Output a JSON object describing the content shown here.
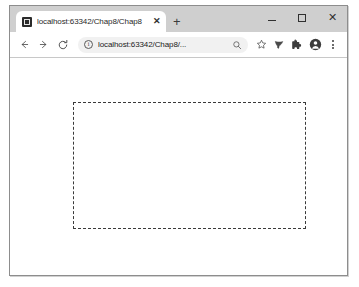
{
  "window": {
    "controls": {
      "minimize": "minimize-button",
      "maximize": "maximize-button",
      "close_label": "✕"
    }
  },
  "tabstrip": {
    "tabs": [
      {
        "favicon": "intellij-favicon",
        "title": "localhost:63342/Chap8/Chap8",
        "close_label": "✕"
      }
    ],
    "new_tab_label": "+"
  },
  "toolbar": {
    "back_label": "←",
    "forward_label": "→",
    "reload_label": "⟳",
    "omnibox": {
      "site_info_icon": "info-circle-icon",
      "url": "localhost:63342/Chap8/...",
      "placeholder": "Search Google or type a URL",
      "zoom_icon": "magnifier-icon",
      "bookmark_icon": "star-icon"
    },
    "actions": [
      {
        "name": "highlighter-icon"
      },
      {
        "name": "extensions-puzzle-icon"
      },
      {
        "name": "profile-avatar-icon"
      },
      {
        "name": "chrome-menu-icon"
      }
    ]
  },
  "page": {
    "dashed_box": {
      "name": "dashed-rectangle",
      "border_style": "dashed",
      "border_color": "#3a3a3a",
      "content": ""
    }
  }
}
